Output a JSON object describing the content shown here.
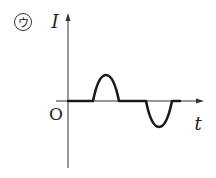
{
  "label": {
    "circled": "ウ",
    "y_axis": "I",
    "x_axis": "t",
    "origin": "O"
  },
  "diagram": {
    "type": "current-time graph",
    "segments": [
      {
        "kind": "zero",
        "from": 0,
        "to": 1
      },
      {
        "kind": "positive-half-sine",
        "from": 1,
        "to": 2
      },
      {
        "kind": "zero",
        "from": 2,
        "to": 3
      },
      {
        "kind": "negative-half-sine",
        "from": 3,
        "to": 4
      },
      {
        "kind": "zero",
        "from": 4,
        "to": 5
      }
    ]
  }
}
